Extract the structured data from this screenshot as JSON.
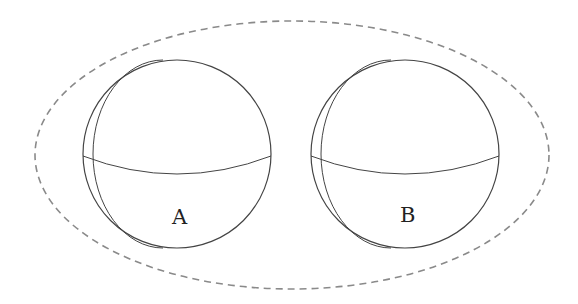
{
  "diagram": {
    "type": "two spheres enclosed by dashed boundary",
    "boundary": {
      "style": "dashed",
      "color": "#8a8a8a",
      "cx": 292,
      "cy": 155,
      "rx": 257,
      "ry": 134
    },
    "spheres": [
      {
        "label": "A",
        "cx": 177,
        "cy": 154,
        "r": 94,
        "stroke": "#444444"
      },
      {
        "label": "B",
        "cx": 405,
        "cy": 154,
        "r": 94,
        "stroke": "#444444"
      }
    ]
  }
}
